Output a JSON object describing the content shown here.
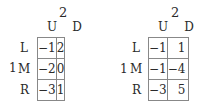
{
  "games": [
    {
      "player_col": "2",
      "player_row": "1",
      "columns": [
        "U",
        "D"
      ],
      "rows": [
        "L",
        "M",
        "R"
      ],
      "payoffs": [
        [
          "−1",
          "2"
        ],
        [
          "−2",
          "0"
        ],
        [
          "−3",
          "1"
        ]
      ]
    },
    {
      "player_col": "2",
      "player_row": "1",
      "columns": [
        "U",
        "D"
      ],
      "rows": [
        "L",
        "M",
        "R"
      ],
      "payoffs": [
        [
          "−1",
          "1"
        ],
        [
          "−1",
          "−4"
        ],
        [
          "−3",
          "5"
        ]
      ]
    }
  ]
}
